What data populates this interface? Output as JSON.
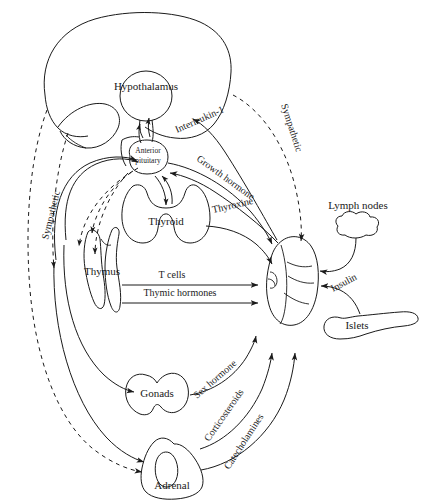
{
  "figure": {
    "type": "diagram",
    "organs": [
      {
        "id": "brain",
        "label": "",
        "shape": "brain-outline"
      },
      {
        "id": "hypothalamus",
        "label": "Hypothalamus",
        "shape": "circle"
      },
      {
        "id": "anterior_pituitary",
        "label_line1": "Anterior",
        "label_line2": "pituitary",
        "shape": "blob"
      },
      {
        "id": "thyroid",
        "label": "Thyroid",
        "shape": "butterfly"
      },
      {
        "id": "thymus",
        "label": "Thymus",
        "shape": "bilobed"
      },
      {
        "id": "gonads",
        "label": "Gonads",
        "shape": "lobed-oval"
      },
      {
        "id": "adrenal",
        "label": "Adrenal",
        "shape": "triangular-gland"
      },
      {
        "id": "spleen",
        "label": "",
        "shape": "spleen-oval"
      },
      {
        "id": "lymph_nodes",
        "label": "Lymph nodes",
        "shape": "cloud"
      },
      {
        "id": "islets",
        "label": "Islets",
        "shape": "pancreas-tail"
      }
    ],
    "pathways": [
      {
        "id": "interleukin_1",
        "label": "Interleukin-1",
        "style": "solid",
        "from": "spleen",
        "to": "hypothalamus"
      },
      {
        "id": "growth_hormone",
        "label": "Growth hormone",
        "style": "solid",
        "from": "anterior_pituitary",
        "to": "spleen"
      },
      {
        "id": "thyroxine",
        "label": "Thyroxine",
        "style": "solid",
        "from": "thyroid",
        "to": "spleen"
      },
      {
        "id": "t_cells",
        "label": "T cells",
        "style": "solid-straight",
        "from": "thymus",
        "to": "spleen"
      },
      {
        "id": "thymic_hormones",
        "label": "Thymic hormones",
        "style": "solid-straight",
        "from": "thymus",
        "to": "spleen"
      },
      {
        "id": "sex_hormone",
        "label": "Sex hormone",
        "style": "solid",
        "from": "gonads",
        "to": "spleen"
      },
      {
        "id": "corticosteroids",
        "label": "Corticosteroids",
        "style": "solid",
        "from": "adrenal",
        "to": "spleen"
      },
      {
        "id": "catecholamines",
        "label": "Catecholamines",
        "style": "solid",
        "from": "adrenal",
        "to": "spleen"
      },
      {
        "id": "insulin",
        "label": "Insulin",
        "style": "solid",
        "from": "islets",
        "to": "spleen"
      },
      {
        "id": "sympathetic_left",
        "label": "Sympathetic",
        "style": "dashed",
        "from": "brain",
        "to": "adrenal"
      },
      {
        "id": "sympathetic_right",
        "label": "Sympathetic",
        "style": "dashed",
        "from": "hypothalamus",
        "to": "spleen"
      }
    ],
    "legend": {
      "solid_meaning": "hormonal / cellular pathway",
      "dashed_meaning": "sympathetic neural pathway"
    }
  }
}
